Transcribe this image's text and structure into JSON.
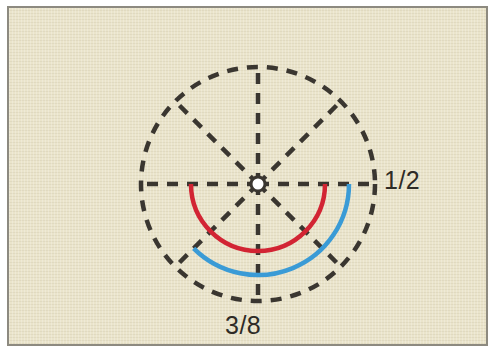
{
  "figure": {
    "background_color": "#eae4cb",
    "border_color": "#8d8a80",
    "outer_color": "#ffffff"
  },
  "labels": {
    "right": "1/2",
    "bottom": "3/8"
  },
  "chart_data": {
    "type": "pie",
    "title": "",
    "subtitle": "",
    "xlabel": "",
    "ylabel": "",
    "grid": true,
    "legend_position": "none",
    "circle": {
      "center": [
        249,
        176
      ],
      "radius": 117,
      "divisions": 8,
      "spoke_angles_deg": [
        0,
        45,
        90,
        135,
        180,
        225,
        270,
        315
      ],
      "stroke": "#3a3630",
      "dash": "11 9",
      "stroke_width": 4.5,
      "hub": {
        "radius": 7,
        "fill": "#ffffff",
        "stroke": "#3a3630"
      }
    },
    "arcs": [
      {
        "name": "half-arc",
        "label": "1/2",
        "fraction": 0.5,
        "sectors": 4,
        "sweep_deg": 180,
        "start_angle_deg": 0,
        "end_angle_deg": 180,
        "radius": 67,
        "color": "#d22433",
        "stroke_width": 4.5
      },
      {
        "name": "three-eighths-arc",
        "label": "3/8",
        "fraction": 0.375,
        "sectors": 3,
        "sweep_deg": 135,
        "start_angle_deg": 0,
        "end_angle_deg": 135,
        "radius": 91,
        "color": "#3a9bd6",
        "stroke_width": 4.5
      }
    ],
    "annotations": [
      {
        "text": "1/2",
        "at": [
          383,
          176
        ],
        "anchor": "left"
      },
      {
        "text": "3/8",
        "at": [
          249,
          318
        ],
        "anchor": "center"
      }
    ]
  }
}
